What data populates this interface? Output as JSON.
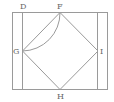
{
  "diagram": {
    "labels": {
      "D": "D",
      "F": "F",
      "G": "G",
      "I": "I",
      "H": "H"
    },
    "points": {
      "D": [
        22,
        12
      ],
      "F": [
        60,
        12
      ],
      "G": [
        22,
        51
      ],
      "I": [
        98,
        51
      ],
      "H": [
        60,
        89
      ]
    },
    "shapes": [
      "outer rectangle",
      "left inner vertical line through D and G",
      "right inner vertical line through I",
      "square (rhombus) F-I-H-G",
      "arc from F to G centered at D"
    ],
    "colors": {
      "line": "#9a9a9a",
      "label": "#666666",
      "background": "#ffffff"
    }
  }
}
